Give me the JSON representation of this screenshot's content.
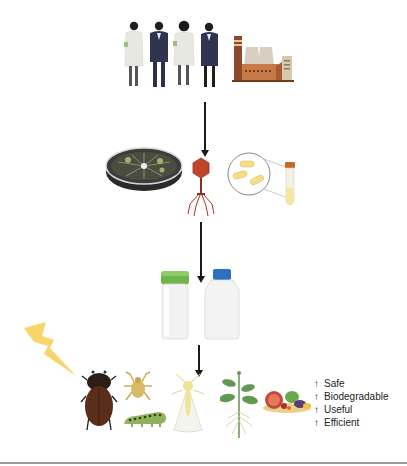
{
  "figure": {
    "stages": [
      {
        "id": "stakeholders",
        "elements": [
          "scientists-and-industry-people",
          "factory"
        ]
      },
      {
        "id": "microbial-sources",
        "elements": [
          "petri-dish",
          "bacteriophage",
          "bacteria-culture"
        ]
      },
      {
        "id": "formulations",
        "elements": [
          "green-cap-bottle",
          "blue-cap-bottle"
        ]
      },
      {
        "id": "applications",
        "elements": [
          "lightning-bolt",
          "beetle",
          "tick",
          "caterpillar",
          "whitefly",
          "plant",
          "produce"
        ]
      }
    ],
    "benefits": [
      {
        "arrow": "↑",
        "label": "Safe"
      },
      {
        "arrow": "↑",
        "label": "Biodegradable"
      },
      {
        "arrow": "↑",
        "label": "Useful"
      },
      {
        "arrow": "↑",
        "label": "Efficient"
      }
    ],
    "colors": {
      "arrow": "#1a1a1a",
      "lab_coat": "#e9e9e4",
      "suit": "#2f3550",
      "factory_brick": "#b8693a",
      "phage": "#c0452b",
      "bacteria": "#f3df8a",
      "bottle_cap_green": "#6fb54a",
      "bottle_cap_blue": "#2f6fbf",
      "lightning": "#f5d66a",
      "beetle": "#5a2e1a",
      "plant_leaf": "#5f9a50",
      "bottom_rule": "#9a9a9a"
    }
  }
}
